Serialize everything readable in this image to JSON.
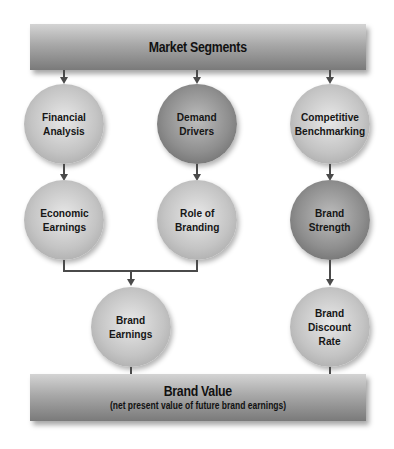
{
  "diagram": {
    "top_bar": {
      "title": "Market Segments"
    },
    "bottom_bar": {
      "title": "Brand Value",
      "subtitle": "(net present value of future brand earnings)"
    },
    "nodes": [
      {
        "id": "financial-analysis",
        "label": "Financial\nAnalysis",
        "shade": "light"
      },
      {
        "id": "demand-drivers",
        "label": "Demand\nDrivers",
        "shade": "dark"
      },
      {
        "id": "competitive-benchmarking",
        "label": "Competitive\nBenchmarking",
        "shade": "light"
      },
      {
        "id": "economic-earnings",
        "label": "Economic\nEarnings",
        "shade": "light"
      },
      {
        "id": "role-of-branding",
        "label": "Role of\nBranding",
        "shade": "light"
      },
      {
        "id": "brand-strength",
        "label": "Brand\nStrength",
        "shade": "dark"
      },
      {
        "id": "brand-earnings",
        "label": "Brand\nEarnings",
        "shade": "light"
      },
      {
        "id": "brand-discount-rate",
        "label": "Brand\nDiscount\nRate",
        "shade": "light"
      }
    ],
    "edges": [
      [
        "Market Segments",
        "Financial Analysis"
      ],
      [
        "Market Segments",
        "Demand Drivers"
      ],
      [
        "Market Segments",
        "Competitive Benchmarking"
      ],
      [
        "Financial Analysis",
        "Economic Earnings"
      ],
      [
        "Demand Drivers",
        "Role of Branding"
      ],
      [
        "Competitive Benchmarking",
        "Brand Strength"
      ],
      [
        "Economic Earnings",
        "Brand Earnings"
      ],
      [
        "Role of Branding",
        "Brand Earnings"
      ],
      [
        "Brand Strength",
        "Brand Discount Rate"
      ],
      [
        "Brand Earnings",
        "Brand Value"
      ],
      [
        "Brand Discount Rate",
        "Brand Value"
      ]
    ]
  }
}
